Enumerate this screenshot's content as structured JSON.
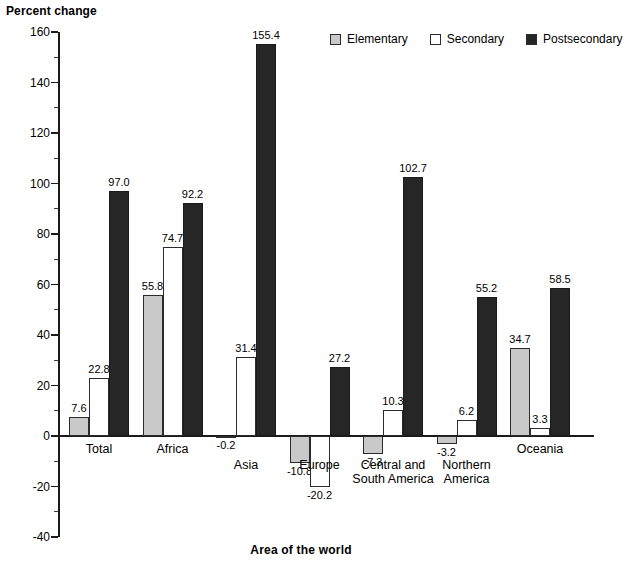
{
  "chart_data": {
    "type": "bar",
    "title": "",
    "ylabel": "Percent change",
    "xlabel": "Area of the world",
    "ylim": [
      -40,
      160
    ],
    "ytick_labels": [
      "160",
      "140",
      "120",
      "100",
      "80",
      "60",
      "40",
      "20",
      "0",
      "-20",
      "-40"
    ],
    "ytick_values": [
      160,
      140,
      120,
      100,
      80,
      60,
      40,
      20,
      0,
      -20,
      -40
    ],
    "minor_tick_values": [
      150,
      130,
      110,
      90,
      70,
      50,
      30,
      10,
      -10,
      -30
    ],
    "grid": false,
    "legend_position": "top-right",
    "categories": [
      "Total",
      "Africa",
      "Asia",
      "Europe",
      "Central and\nSouth America",
      "Northern\nAmerica",
      "Oceania"
    ],
    "series": [
      {
        "name": "Elementary",
        "color": "#c9c9c9",
        "values": [
          7.6,
          55.8,
          -0.2,
          -10.8,
          -7.3,
          -3.2,
          34.7
        ],
        "labels": [
          "7.6",
          "55.8",
          "-0.2",
          "-10.8",
          "-7.3",
          "-3.2",
          "34.7"
        ]
      },
      {
        "name": "Secondary",
        "color": "#ffffff",
        "values": [
          22.8,
          74.7,
          31.4,
          -20.2,
          10.3,
          6.2,
          3.3
        ],
        "labels": [
          "22.8",
          "74.7",
          "31.4",
          "-20.2",
          "10.3",
          "6.2",
          "3.3"
        ]
      },
      {
        "name": "Postsecondary",
        "color": "#262626",
        "values": [
          97.0,
          92.2,
          155.4,
          27.2,
          102.7,
          55.2,
          58.5
        ],
        "labels": [
          "97.0",
          "92.2",
          "155.4",
          "27.2",
          "102.7",
          "55.2",
          "58.5"
        ]
      }
    ]
  },
  "axes": {
    "y_title": "Percent change",
    "x_title": "Area of the world"
  },
  "legend": {
    "items": [
      {
        "label": "Elementary",
        "swatch": "elementary"
      },
      {
        "label": "Secondary",
        "swatch": "secondary"
      },
      {
        "label": "Postsecondary",
        "swatch": "postsecondary"
      }
    ]
  }
}
